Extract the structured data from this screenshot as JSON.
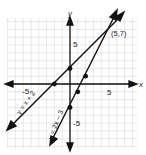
{
  "chart_data": {
    "type": "line",
    "title": "",
    "xlabel": "x",
    "ylabel": "y",
    "xlim": [
      -8,
      8
    ],
    "ylim": [
      -8,
      8
    ],
    "grid": true,
    "x_ticks_labeled": [
      "-5",
      "5"
    ],
    "y_ticks_labeled": [
      "5",
      "-5"
    ],
    "series": [
      {
        "name": "y = x + 2",
        "slope": 1,
        "intercept": 2,
        "marked_points": [
          [
            -2,
            0
          ],
          [
            0,
            2
          ]
        ]
      },
      {
        "name": "y = 2x - 3",
        "slope": 2,
        "intercept": -3,
        "marked_points": [
          [
            0,
            -3
          ],
          [
            1,
            -1
          ],
          [
            2,
            1
          ]
        ]
      }
    ],
    "annotations": [
      {
        "text": "(5,7)",
        "x": 5,
        "y": 7,
        "note": "intersection point"
      }
    ]
  },
  "labels": {
    "x_axis": "x",
    "y_axis": "y",
    "x_tick_neg": "-5",
    "x_tick_pos": "5",
    "y_tick_pos": "5",
    "y_tick_neg": "-5",
    "line1": "y = x + 2",
    "line2": "y = 2x − 3",
    "intersection": "(5,7)"
  }
}
